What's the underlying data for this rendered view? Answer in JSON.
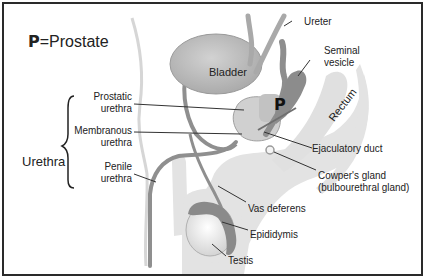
{
  "title": {
    "symbol": "P",
    "text": "=Prostate"
  },
  "group_label": "Urethra",
  "organ_labels": {
    "bladder": "Bladder",
    "prostate_mark": "P",
    "rectum": "Rectum"
  },
  "left_labels": {
    "prostatic": [
      "Prostatic",
      "urethra"
    ],
    "membranous": [
      "Membranous",
      "urethra"
    ],
    "penile": [
      "Penile",
      "urethra"
    ]
  },
  "right_labels": {
    "ureter": "Ureter",
    "seminal": [
      "Seminal",
      "vesicle"
    ],
    "ejaculatory": "Ejaculatory duct",
    "cowper": [
      "Cowper's gland",
      "(bulbourethral gland)"
    ],
    "vas": "Vas deferens",
    "epididymis": "Epididymis",
    "testis": "Testis"
  },
  "colors": {
    "organ_gray": "#b4b4b4",
    "body_light": "#e3e3e3",
    "dark_gland": "#8c8c8c",
    "outline": "#7a7a7a",
    "frame": "#2a2a2a"
  }
}
